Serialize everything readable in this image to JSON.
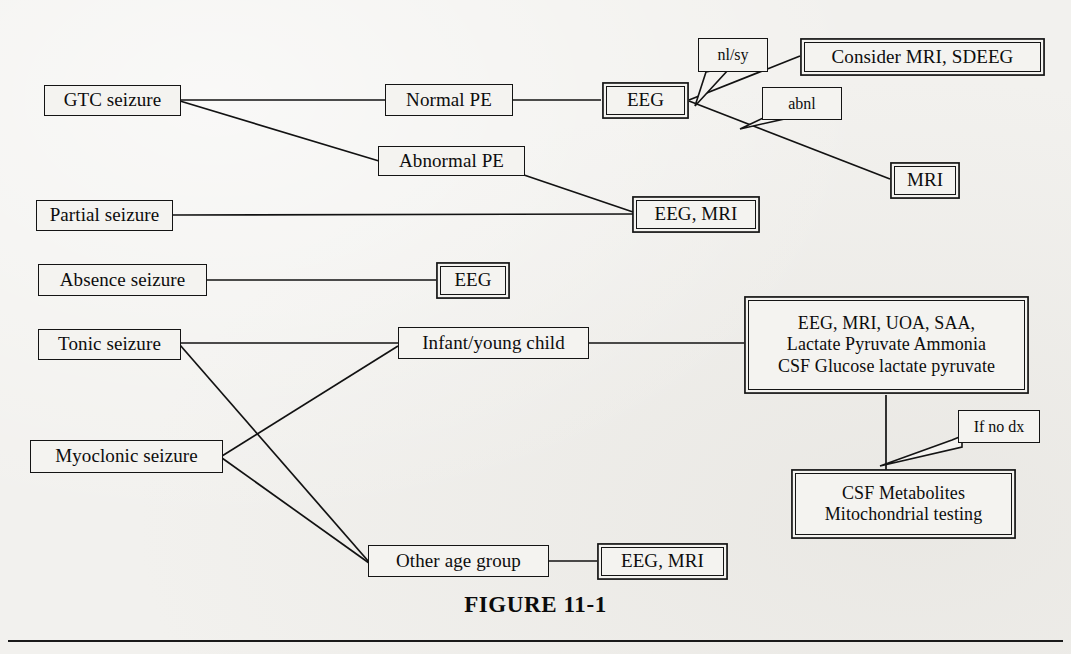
{
  "figure": {
    "caption": "FIGURE 11-1",
    "background_color": "#f2f1ee",
    "ink_color": "#121212"
  },
  "nodes": {
    "gtc_seizure": {
      "label": "GTC seizure"
    },
    "partial_seizure": {
      "label": "Partial seizure"
    },
    "absence_seizure": {
      "label": "Absence seizure"
    },
    "tonic_seizure": {
      "label": "Tonic seizure"
    },
    "myoclonic_seizure": {
      "label": "Myoclonic  seizure"
    },
    "normal_pe": {
      "label": "Normal PE"
    },
    "abnormal_pe": {
      "label": "Abnormal PE"
    },
    "eeg_top": {
      "label": "EEG"
    },
    "eeg_absence": {
      "label": "EEG"
    },
    "consider_mri_sdeeg": {
      "label": "Consider MRI, SDEEG"
    },
    "mri": {
      "label": "MRI"
    },
    "eeg_mri_partial": {
      "label": "EEG, MRI"
    },
    "eeg_mri_other": {
      "label": "EEG, MRI"
    },
    "infant_young_child": {
      "label": "Infant/young child"
    },
    "other_age_group": {
      "label": "Other age group"
    },
    "metabolic_workup": {
      "line1": "EEG, MRI, UOA, SAA,",
      "line2": "Lactate Pyruvate Ammonia",
      "line3": "CSF Glucose lactate pyruvate"
    },
    "csf_metabolites": {
      "line1": "CSF Metabolites",
      "line2": "Mitochondrial testing"
    }
  },
  "callouts": {
    "nl_sy": {
      "label": "nl/sy"
    },
    "abnl": {
      "label": "abnl"
    },
    "if_no_dx": {
      "label": "If no dx"
    }
  }
}
